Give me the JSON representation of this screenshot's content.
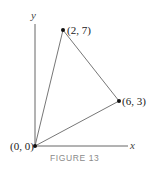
{
  "figure": {
    "caption": "FIGURE 13",
    "axes": {
      "x_label": "x",
      "y_label": "y"
    },
    "points": [
      {
        "label": "(0, 0)",
        "x": 0,
        "y": 0
      },
      {
        "label": "(2, 7)",
        "x": 2,
        "y": 7
      },
      {
        "label": "(6, 3)",
        "x": 6,
        "y": 3
      }
    ],
    "shape": "triangle",
    "colors": {
      "line": "#777777",
      "axis": "#666666",
      "point": "#111111",
      "caption": "#8a8a8a"
    }
  }
}
